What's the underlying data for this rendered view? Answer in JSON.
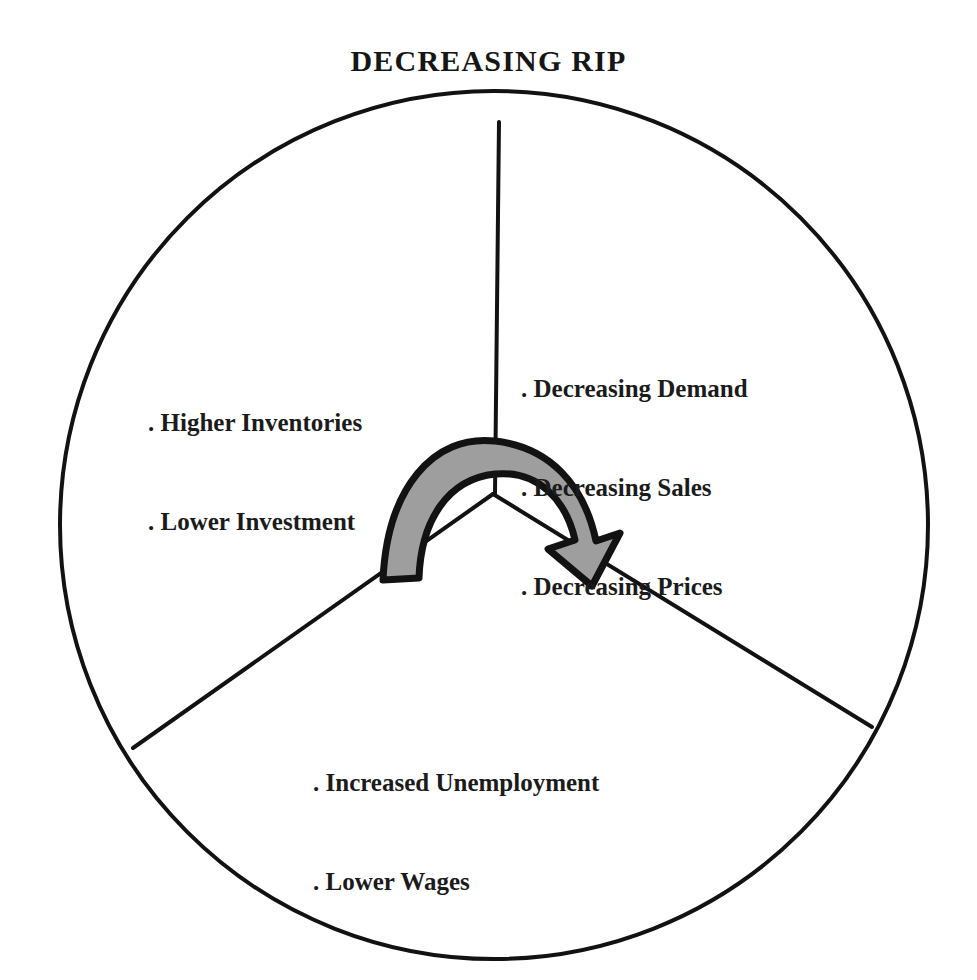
{
  "title": "DECREASING RIP",
  "colors": {
    "stroke": "#121212",
    "arrow_fill": "#9e9e9e",
    "arrow_outline": "#121212",
    "text": "#1b1b1b",
    "background": "#ffffff"
  },
  "diagram": {
    "type": "three-sector-circle-with-cycle-arrow",
    "center": {
      "x": 493,
      "y": 494
    },
    "radius": 434,
    "sectors": [
      {
        "id": "right",
        "name": "decreasing-demand-sector",
        "lines": [
          ". Decreasing Demand",
          ". Decreasing Sales",
          ". Decreasing Prices"
        ]
      },
      {
        "id": "left",
        "name": "higher-inventories-sector",
        "lines": [
          ". Higher Inventories",
          ". Lower Investment"
        ]
      },
      {
        "id": "bottom",
        "name": "increased-unemployment-sector",
        "lines": [
          ". Increased Unemployment",
          ". Lower Wages"
        ]
      }
    ],
    "divider_angles_deg": [
      90,
      210,
      330
    ],
    "cycle_arrow": {
      "name": "cycle-arrow",
      "direction": "clockwise",
      "tail_sector": "left",
      "head_sector": "bottom",
      "fill": "#9e9e9e"
    }
  }
}
